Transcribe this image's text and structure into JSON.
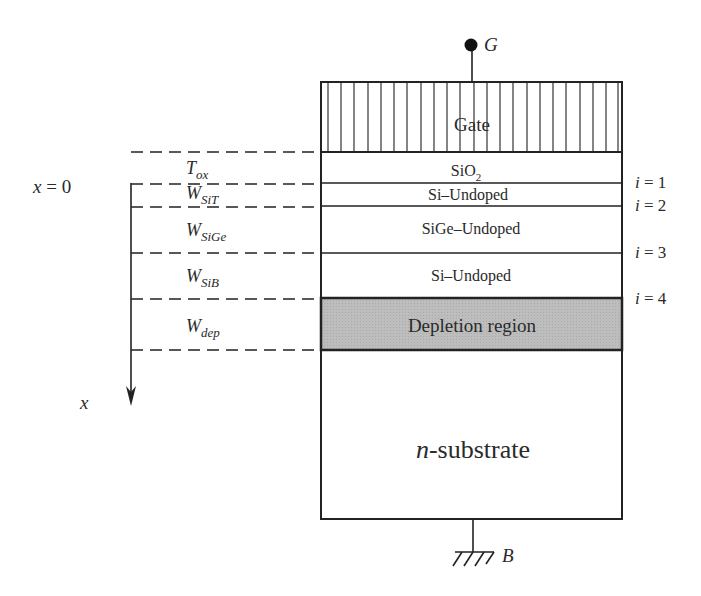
{
  "terminals": {
    "gate": "G",
    "body": "B"
  },
  "layers": [
    {
      "name": "Gate",
      "label": "Gate",
      "fill": "hatched"
    },
    {
      "name": "oxide",
      "label_main": "SiO",
      "label_sub": "2"
    },
    {
      "name": "si-top",
      "label": "Si–Undoped"
    },
    {
      "name": "sige",
      "label": "SiGe–Undoped"
    },
    {
      "name": "si-bottom",
      "label": "Si–Undoped"
    },
    {
      "name": "depletion",
      "label": "Depletion region",
      "fill": "#b9b9b9"
    },
    {
      "name": "substrate",
      "label_italic": "n",
      "label_rest": "-substrate"
    }
  ],
  "thickness_labels": [
    {
      "main": "T",
      "sub": "ox"
    },
    {
      "main": "W",
      "sub": "SiT"
    },
    {
      "main": "W",
      "sub": "SiGe"
    },
    {
      "main": "W",
      "sub": "SiB"
    },
    {
      "main": "W",
      "sub": "dep"
    }
  ],
  "interfaces": [
    {
      "var": "i",
      "eq": " = ",
      "val": "1"
    },
    {
      "var": "i",
      "eq": " = ",
      "val": "2"
    },
    {
      "var": "i",
      "eq": " = ",
      "val": "3"
    },
    {
      "var": "i",
      "eq": " = ",
      "val": "4"
    }
  ],
  "axis": {
    "origin_var": "x",
    "origin_eq": " = 0",
    "axis_label": "x"
  }
}
